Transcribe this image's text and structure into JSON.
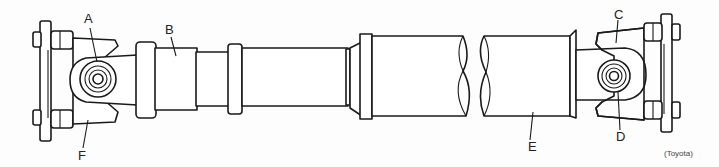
{
  "diagram": {
    "labels": {
      "A": "A",
      "B": "B",
      "C": "C",
      "D": "D",
      "E": "E",
      "F": "F"
    },
    "credit": "(Toyota)"
  }
}
